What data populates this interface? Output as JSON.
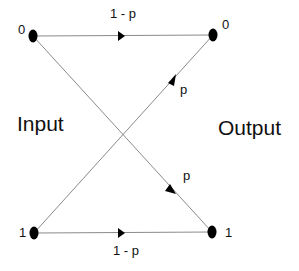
{
  "diagram": {
    "type": "binary-symmetric-channel",
    "side_labels": {
      "input": "Input",
      "output": "Output"
    },
    "nodes": {
      "input_0": {
        "label": "0"
      },
      "input_1": {
        "label": "1"
      },
      "output_0": {
        "label": "0"
      },
      "output_1": {
        "label": "1"
      }
    },
    "edges": [
      {
        "from": "input_0",
        "to": "output_0",
        "label": "1 - p"
      },
      {
        "from": "input_1",
        "to": "output_0",
        "label": "p"
      },
      {
        "from": "input_0",
        "to": "output_1",
        "label": "p"
      },
      {
        "from": "input_1",
        "to": "output_1",
        "label": "1 - p"
      }
    ],
    "colors": {
      "line": "#8a8a8a",
      "node": "#000000",
      "text": "#111111"
    }
  }
}
